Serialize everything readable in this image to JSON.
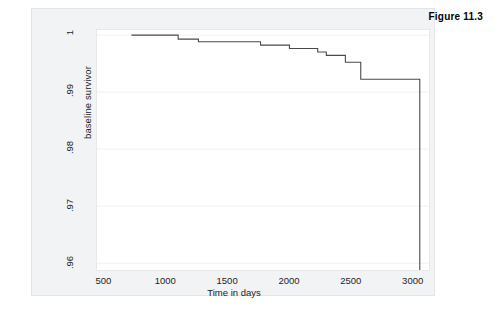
{
  "figure": {
    "caption": "Figure 11.3"
  },
  "chart_data": {
    "type": "line",
    "subtype": "step",
    "title": "",
    "xlabel": "Time in days",
    "ylabel": "baseline survivor",
    "xlim": [
      440,
      3140
    ],
    "ylim": [
      0.9588,
      1.0009
    ],
    "xticks": [
      500,
      1000,
      1500,
      2000,
      2500,
      3000
    ],
    "xticklabels": [
      "500",
      "1000",
      "1500",
      "2000",
      "2500",
      "3000"
    ],
    "yticks": [
      1,
      0.99,
      0.98,
      0.97,
      0.96
    ],
    "yticklabels": [
      "1",
      ".99",
      ".98",
      ".97",
      ".96"
    ],
    "grid": "horizontal-faint",
    "legend": "none",
    "line_color": "#4a4a4a",
    "series": [
      {
        "name": "baseline survivor",
        "x": [
          720,
          1100,
          1100,
          1265,
          1265,
          1770,
          1770,
          2005,
          2005,
          2235,
          2235,
          2305,
          2305,
          2460,
          2460,
          2585,
          2585,
          3065,
          3065
        ],
        "y": [
          1.0,
          1.0,
          0.9993,
          0.9993,
          0.99885,
          0.99885,
          0.99825,
          0.99825,
          0.99765,
          0.99765,
          0.99705,
          0.99705,
          0.99645,
          0.99645,
          0.99525,
          0.99525,
          0.99225,
          0.99225,
          0.9588
        ]
      }
    ]
  }
}
